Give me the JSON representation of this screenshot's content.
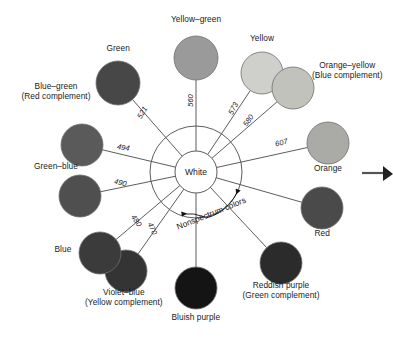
{
  "figure": {
    "center_label": "White",
    "nonspectrum_label": "Nonspectrum colors"
  },
  "chart_data": {
    "type": "diagram",
    "center": "White",
    "annotation": "Nonspectrum colors",
    "colors": [
      {
        "id": "yellow-green",
        "label": "Yellow–green",
        "complement": "",
        "wavelength": "560",
        "swatch": "#9a9a9a",
        "cx": 196,
        "cy": 58,
        "r": 22,
        "label_x": 196,
        "label_y": 19
      },
      {
        "id": "yellow",
        "label": "Yellow",
        "complement": "",
        "wavelength": "573",
        "swatch": "#cfcfcb",
        "cx": 262,
        "cy": 73,
        "r": 21,
        "label_x": 262,
        "label_y": 38
      },
      {
        "id": "orange-yellow",
        "label": "Orange–yellow",
        "complement": "(Blue complement)",
        "wavelength": "580",
        "swatch": "#c2c2bd",
        "cx": 293,
        "cy": 88,
        "r": 21,
        "label_x": 347,
        "label_y": 70
      },
      {
        "id": "orange",
        "label": "Orange",
        "complement": "",
        "wavelength": "607",
        "swatch": "#aaaaa6",
        "cx": 328,
        "cy": 143,
        "r": 21,
        "label_x": 328,
        "label_y": 168
      },
      {
        "id": "red",
        "label": "Red",
        "complement": "",
        "wavelength": "",
        "swatch": "#4a4a4a",
        "cx": 322,
        "cy": 208,
        "r": 21,
        "label_x": 322,
        "label_y": 233
      },
      {
        "id": "reddish-purple",
        "label": "Reddish purple",
        "complement": "(Green complement)",
        "wavelength": "",
        "swatch": "#2b2b2b",
        "cx": 281,
        "cy": 263,
        "r": 21,
        "label_x": 281,
        "label_y": 290
      },
      {
        "id": "bluish-purple",
        "label": "Bluish purple",
        "complement": "",
        "wavelength": "",
        "swatch": "#141414",
        "cx": 196,
        "cy": 288,
        "r": 21,
        "label_x": 196,
        "label_y": 317
      },
      {
        "id": "violet-blue",
        "label": "Violet–blue",
        "complement": "(Yellow complement)",
        "wavelength": "470",
        "swatch": "#343434",
        "cx": 126,
        "cy": 271,
        "r": 21,
        "label_x": 124,
        "label_y": 297
      },
      {
        "id": "blue",
        "label": "Blue",
        "complement": "",
        "wavelength": "480",
        "swatch": "#3b3b3b",
        "cx": 100,
        "cy": 253,
        "r": 21,
        "label_x": 63,
        "label_y": 249
      },
      {
        "id": "green-blue",
        "label": "Green–blue",
        "complement": "",
        "wavelength": "490",
        "swatch": "#4f4f4f",
        "cx": 80,
        "cy": 196,
        "r": 21,
        "label_x": 56,
        "label_y": 166
      },
      {
        "id": "blue-green",
        "label": "Blue–green",
        "complement": "(Red complement)",
        "wavelength": "494",
        "swatch": "#5a5a5a",
        "cx": 82,
        "cy": 145,
        "r": 21,
        "label_x": 56,
        "label_y": 91
      },
      {
        "id": "green",
        "label": "Green",
        "complement": "",
        "wavelength": "521",
        "swatch": "#474747",
        "cx": 118,
        "cy": 83,
        "r": 22,
        "label_x": 118,
        "label_y": 48
      }
    ],
    "wavelength_labels": [
      {
        "value": "521",
        "x": 142,
        "y": 112,
        "rotate": -60
      },
      {
        "value": "560",
        "x": 190,
        "y": 100,
        "rotate": -90
      },
      {
        "value": "573",
        "x": 233,
        "y": 108,
        "rotate": -62
      },
      {
        "value": "580",
        "x": 248,
        "y": 120,
        "rotate": -55
      },
      {
        "value": "607",
        "x": 281,
        "y": 142,
        "rotate": -14
      },
      {
        "value": "494",
        "x": 123,
        "y": 147,
        "rotate": 9
      },
      {
        "value": "490",
        "x": 120,
        "y": 182,
        "rotate": 14
      },
      {
        "value": "480",
        "x": 136,
        "y": 220,
        "rotate": 56
      },
      {
        "value": "470",
        "x": 152,
        "y": 228,
        "rotate": 66
      }
    ]
  }
}
